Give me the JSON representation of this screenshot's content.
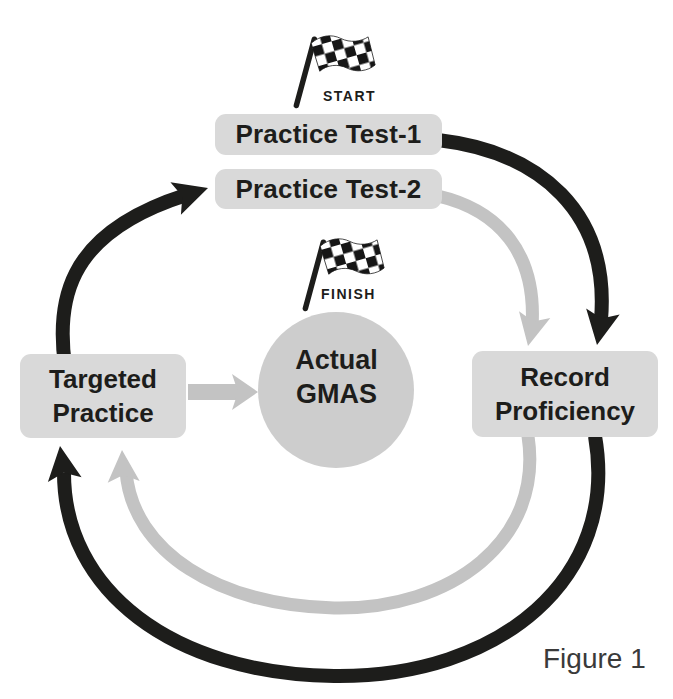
{
  "figure": {
    "caption": "Figure 1"
  },
  "flags": {
    "start": {
      "icon": "checkered-flag-icon",
      "label": "START"
    },
    "finish": {
      "icon": "checkered-flag-icon",
      "label": "FINISH"
    }
  },
  "nodes": {
    "practice_test_1": {
      "label": "Practice Test-1"
    },
    "practice_test_2": {
      "label": "Practice Test-2"
    },
    "targeted_practice": {
      "lines": [
        "Targeted",
        "Practice"
      ]
    },
    "record_proficiency": {
      "lines": [
        "Record",
        "Proficiency"
      ]
    },
    "actual_gmas": {
      "lines": [
        "Actual",
        "GMAS"
      ]
    }
  },
  "arrows": [
    {
      "name": "practice-test-1-to-record-proficiency",
      "color": "#1d1d1b",
      "style": "outer-arc"
    },
    {
      "name": "practice-test-2-to-record-proficiency",
      "color": "#c3c3c3",
      "style": "inner-arc"
    },
    {
      "name": "record-proficiency-to-targeted-practice-outer",
      "color": "#1d1d1b",
      "style": "outer-arc"
    },
    {
      "name": "record-proficiency-to-targeted-practice-inner",
      "color": "#c3c3c3",
      "style": "inner-arc"
    },
    {
      "name": "targeted-practice-to-practice-test-2",
      "color": "#1d1d1b",
      "style": "outer-arc"
    },
    {
      "name": "targeted-practice-to-actual-gmas",
      "color": "#c3c3c3",
      "style": "straight"
    }
  ],
  "colors": {
    "ink": "#1d1d1b",
    "gray": "#c3c3c3",
    "box_fill": "#d9d9d9",
    "circle_fill": "#cdcdcd",
    "caption_text": "#3a3a3a",
    "background": "#ffffff"
  }
}
